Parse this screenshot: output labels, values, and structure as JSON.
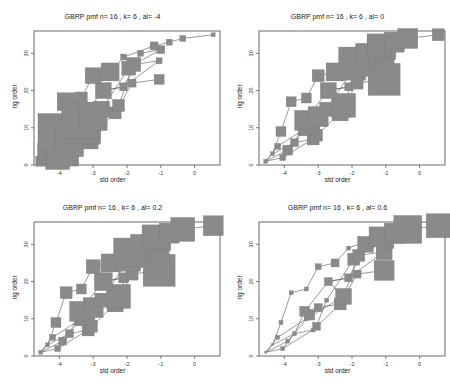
{
  "chart_data": [
    {
      "type": "scatter",
      "title": "GBRP pmf  n= 16 , k= 6 , al= -4",
      "xlabel": "std order",
      "ylabel": "rig order",
      "xlim": [
        -4.75,
        0.75
      ],
      "ylim": [
        0,
        36
      ],
      "xticks": [
        -4,
        -3,
        -2,
        -1,
        0
      ],
      "yticks": [
        0,
        10,
        20,
        30
      ],
      "grid": false,
      "size_trend": "large at low std order, small at high"
    },
    {
      "type": "scatter",
      "title": "GBRP pmf  n= 16 , k= 6 , al= 0",
      "xlabel": "std order",
      "ylabel": "rig order",
      "xlim": [
        -4.75,
        0.75
      ],
      "ylim": [
        0,
        36
      ],
      "xticks": [
        -4,
        -3,
        -2,
        -1,
        0
      ],
      "yticks": [
        0,
        10,
        20,
        30
      ],
      "grid": false,
      "size_trend": "small at low std order, large at high"
    },
    {
      "type": "scatter",
      "title": "GBRP pmf  n= 16 , k= 6 , al= 0.2",
      "xlabel": "std order",
      "ylabel": "rig order",
      "xlim": [
        -4.75,
        0.75
      ],
      "ylim": [
        0,
        36
      ],
      "xticks": [
        -4,
        -3,
        -2,
        -1,
        0
      ],
      "yticks": [
        0,
        10,
        20,
        30
      ],
      "grid": false,
      "size_trend": "small at low std order, large at high"
    },
    {
      "type": "scatter",
      "title": "GBRP pmf  n= 16 , k= 6 , al= 0.6",
      "xlabel": "std order",
      "ylabel": "rig order",
      "xlim": [
        -4.75,
        0.75
      ],
      "ylim": [
        0,
        36
      ],
      "xticks": [
        -4,
        -3,
        -2,
        -1,
        0
      ],
      "yticks": [
        0,
        10,
        20,
        30
      ],
      "grid": false,
      "size_trend": "small markers mostly, larger toward top-right"
    }
  ],
  "points": [
    {
      "x": -4.55,
      "y": 1
    },
    {
      "x": -4.35,
      "y": 3
    },
    {
      "x": -4.2,
      "y": 5
    },
    {
      "x": -4.05,
      "y": 2
    },
    {
      "x": -3.9,
      "y": 4
    },
    {
      "x": -4.1,
      "y": 9
    },
    {
      "x": -3.7,
      "y": 6
    },
    {
      "x": -3.15,
      "y": 7
    },
    {
      "x": -3.05,
      "y": 8
    },
    {
      "x": -3.8,
      "y": 17
    },
    {
      "x": -3.35,
      "y": 10
    },
    {
      "x": -3.25,
      "y": 11
    },
    {
      "x": -3.4,
      "y": 12
    },
    {
      "x": -3.0,
      "y": 13
    },
    {
      "x": -2.35,
      "y": 14
    },
    {
      "x": -2.75,
      "y": 15
    },
    {
      "x": -2.25,
      "y": 16
    },
    {
      "x": -3.35,
      "y": 18
    },
    {
      "x": -2.7,
      "y": 20
    },
    {
      "x": -2.1,
      "y": 21
    },
    {
      "x": -1.85,
      "y": 22
    },
    {
      "x": -1.05,
      "y": 23
    },
    {
      "x": -3.0,
      "y": 24
    },
    {
      "x": -2.5,
      "y": 25
    },
    {
      "x": -1.95,
      "y": 26
    },
    {
      "x": -1.8,
      "y": 27
    },
    {
      "x": -1.05,
      "y": 28
    },
    {
      "x": -2.1,
      "y": 29
    },
    {
      "x": -1.6,
      "y": 30
    },
    {
      "x": -1.0,
      "y": 31
    },
    {
      "x": -1.2,
      "y": 32
    },
    {
      "x": -0.75,
      "y": 33
    },
    {
      "x": -0.35,
      "y": 34
    },
    {
      "x": 0.55,
      "y": 35
    }
  ],
  "chains": [
    [
      0,
      1,
      5,
      9,
      17,
      22,
      23,
      27,
      30,
      31,
      32,
      33
    ],
    [
      0,
      2,
      10,
      16,
      18,
      19,
      28,
      29
    ],
    [
      0,
      3,
      6,
      7,
      8,
      15,
      24,
      25,
      26
    ],
    [
      0,
      4,
      11,
      12,
      13,
      14,
      20,
      21
    ],
    [
      1,
      6,
      12,
      18,
      19,
      26
    ],
    [
      3,
      7,
      14,
      16,
      25,
      29
    ]
  ],
  "sizes": {
    "p1": [
      5,
      10,
      14,
      12,
      16,
      18,
      14,
      10,
      9,
      9,
      16,
      16,
      18,
      14,
      6,
      8,
      6,
      6,
      8,
      4,
      4,
      5,
      8,
      9,
      7,
      7,
      3,
      3,
      3,
      4,
      4,
      3,
      3,
      2
    ],
    "p2": [
      2,
      2,
      3,
      3,
      5,
      5,
      4,
      6,
      6,
      5,
      8,
      10,
      10,
      10,
      8,
      7,
      12,
      5,
      8,
      4,
      6,
      16,
      6,
      9,
      12,
      12,
      10,
      10,
      10,
      10,
      12,
      10,
      10,
      6
    ],
    "p3": [
      2,
      2,
      3,
      3,
      4,
      5,
      4,
      6,
      6,
      6,
      7,
      10,
      10,
      10,
      8,
      7,
      12,
      5,
      9,
      5,
      6,
      16,
      7,
      9,
      12,
      12,
      10,
      10,
      10,
      10,
      12,
      10,
      12,
      10
    ],
    "p4": [
      1,
      1,
      2,
      2,
      2,
      2,
      2,
      2,
      4,
      2,
      2,
      5,
      5,
      4,
      6,
      2,
      8,
      2,
      4,
      4,
      4,
      10,
      3,
      4,
      6,
      6,
      8,
      2,
      8,
      8,
      10,
      10,
      14,
      12
    ]
  },
  "colors": {
    "marker": "#8a8a8a",
    "line": "#555555",
    "axis": "#444444"
  }
}
